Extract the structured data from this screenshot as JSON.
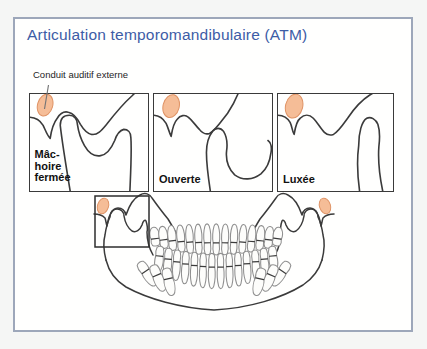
{
  "card": {
    "title": "Articulation temporomandibulaire (ATM)",
    "annotation": "Conduit auditif externe",
    "panels": [
      {
        "caption": "Mâchoire fermée",
        "caption_lines": [
          "Mâc-",
          "hoire",
          "fermée"
        ]
      },
      {
        "caption": "Ouverte",
        "caption_lines": [
          "Ouverte"
        ]
      },
      {
        "caption": "Luxée",
        "caption_lines": [
          "Luxée"
        ]
      }
    ],
    "colors": {
      "accent_blue": "#3D5CA6",
      "frame_gray_blue": "#9DA7BA",
      "line_dark": "#3B3B3B",
      "teeth_gray": "#8F8F8F",
      "ear_canal_fill": "#F5BD97",
      "ear_canal_stroke": "#DF9365",
      "page_bg": "#F5F6F5",
      "card_bg": "#FFFFFE"
    }
  }
}
